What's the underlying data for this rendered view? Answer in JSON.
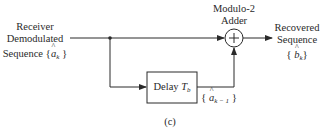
{
  "diagram": {
    "input_label": {
      "line1": "Receiver",
      "line2": "Demodulated",
      "line3_prefix": "Sequence",
      "symbol": "a",
      "subscript": "k"
    },
    "adder_label": {
      "line1": "Modulo-2",
      "line2": "Adder",
      "symbol": "+"
    },
    "output_label": {
      "line1": "Recovered",
      "line2": "Sequence",
      "symbol": "b",
      "subscript": "k"
    },
    "delay_block": {
      "text": "Delay",
      "symbol": "T",
      "subscript": "b"
    },
    "delayed_label": {
      "symbol": "a",
      "subscript": "k − 1"
    },
    "caption": "(c)",
    "colors": {
      "line": "#2a2a2a",
      "background": "#ffffff"
    }
  }
}
